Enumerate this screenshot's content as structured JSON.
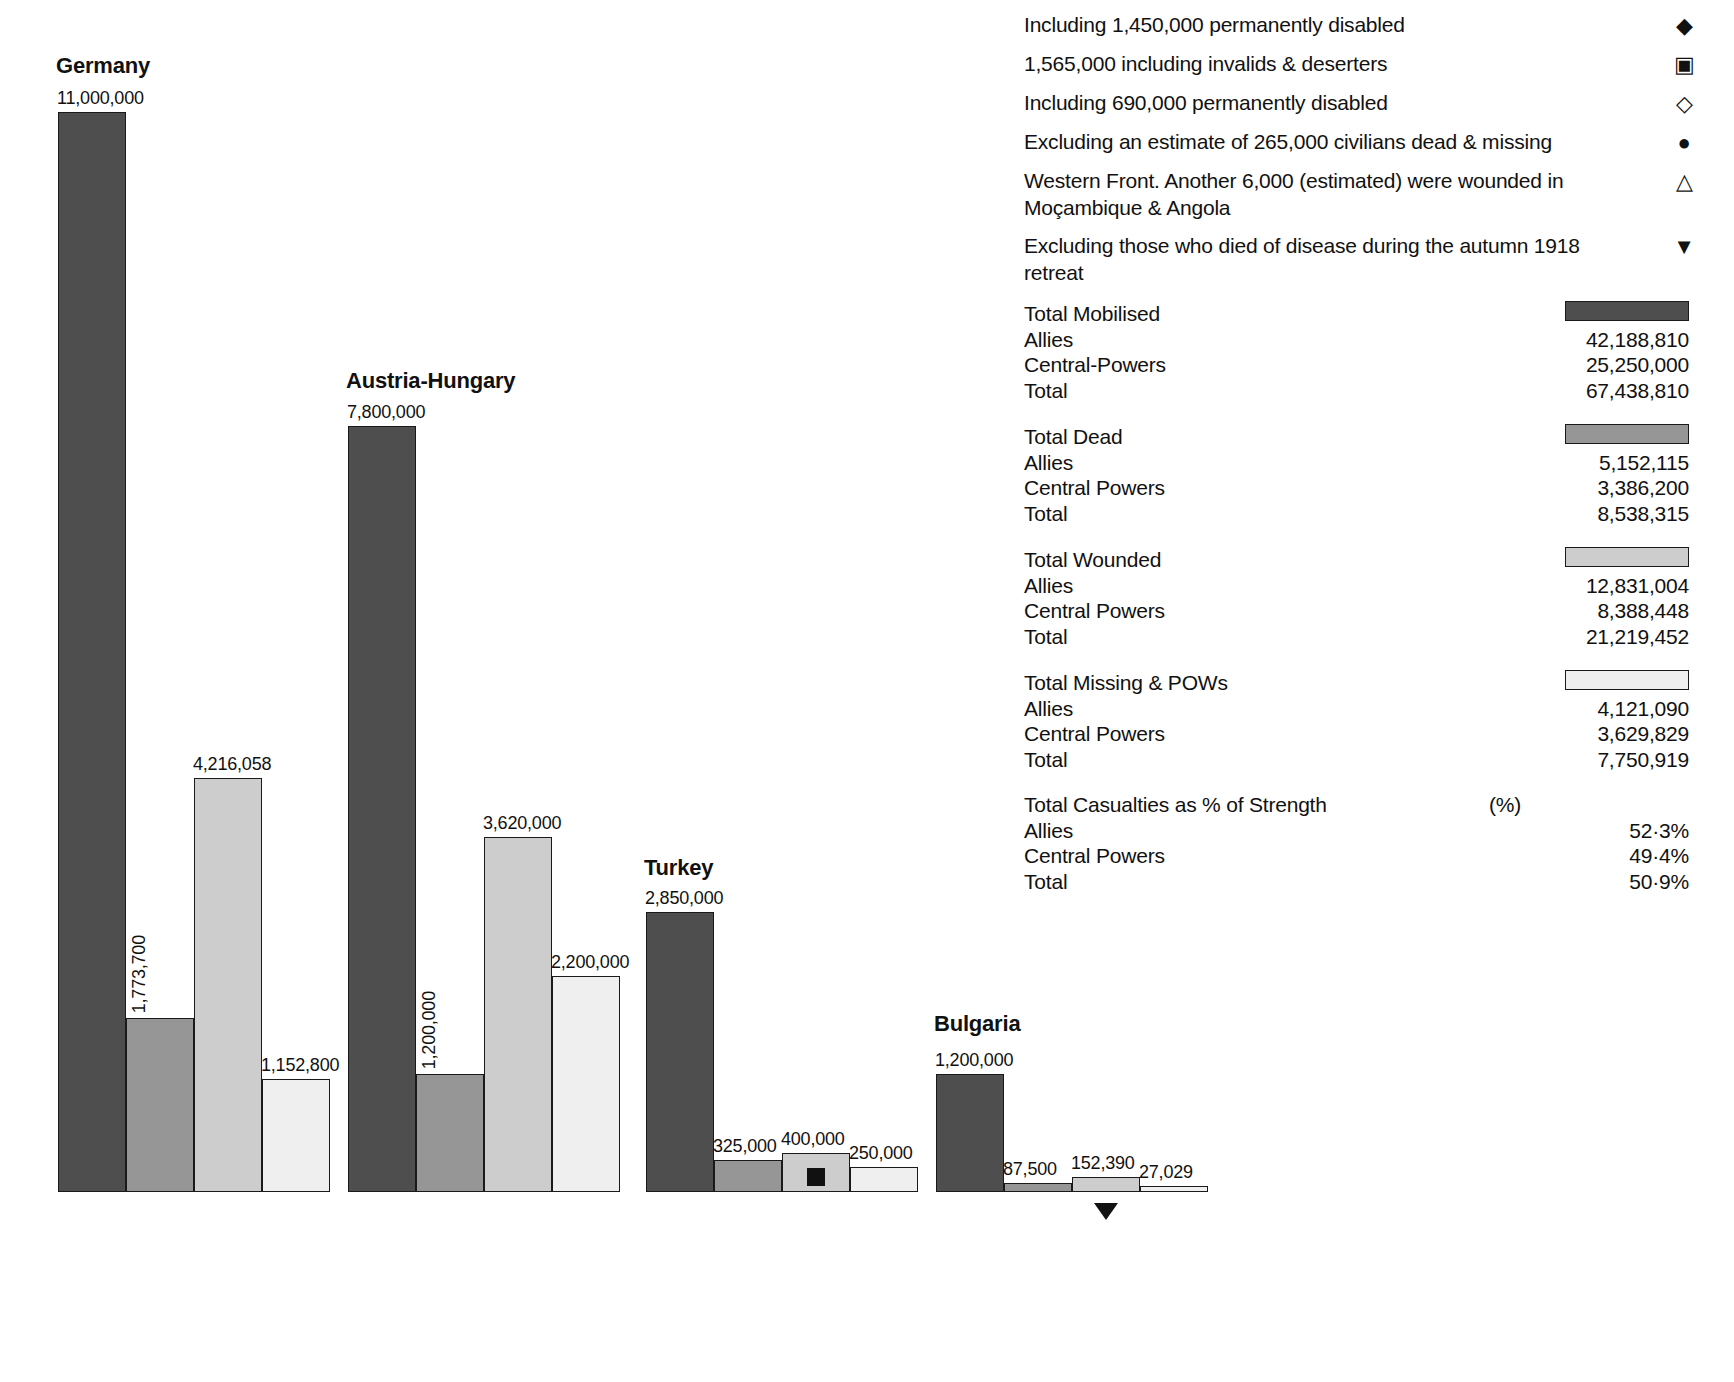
{
  "chart_data": {
    "type": "bar",
    "title": "",
    "xlabel": "",
    "ylabel": "",
    "categories": [
      "Total Mobilised",
      "Total Dead",
      "Total Wounded",
      "Total Missing & POWs"
    ],
    "groups": [
      {
        "name": "Germany",
        "values": [
          11000000,
          1773700,
          4216058,
          1152800
        ],
        "labels": [
          "11,000,000",
          "1,773,700",
          "4,216,058",
          "1,152,800"
        ]
      },
      {
        "name": "Austria-Hungary",
        "values": [
          7800000,
          1200000,
          3620000,
          2200000
        ],
        "labels": [
          "7,800,000",
          "1,200,000",
          "3,620,000",
          "2,200,000"
        ]
      },
      {
        "name": "Turkey",
        "values": [
          2850000,
          325000,
          400000,
          250000
        ],
        "labels": [
          "2,850,000",
          "325,000",
          "400,000",
          "250,000"
        ]
      },
      {
        "name": "Bulgaria",
        "values": [
          1200000,
          87500,
          152390,
          27029
        ],
        "labels": [
          "1,200,000",
          "87,500",
          "152,390",
          "27,029"
        ]
      }
    ],
    "series_colors": [
      "#4e4e4e",
      "#969696",
      "#cdcdcd",
      "#efefef"
    ],
    "markers": [
      {
        "group": "Turkey",
        "series": "Total Wounded",
        "symbol": "filled-square",
        "position": "in-bar"
      },
      {
        "group": "Bulgaria",
        "series": "Total Wounded",
        "symbol": "filled-triangle-down",
        "position": "below-axis"
      }
    ],
    "ylim": [
      0,
      11000000
    ],
    "grid": false,
    "legend_position": "right"
  },
  "groups": [
    {
      "title": "Germany",
      "bars": [
        {
          "series": "mob",
          "label": "11,000,000",
          "orient": "horizontal"
        },
        {
          "series": "dead",
          "label": "1,773,700",
          "orient": "vertical"
        },
        {
          "series": "wnd",
          "label": "4,216,058",
          "orient": "horizontal"
        },
        {
          "series": "miss",
          "label": "1,152,800",
          "orient": "horizontal"
        }
      ]
    },
    {
      "title": "Austria-Hungary",
      "bars": [
        {
          "series": "mob",
          "label": "7,800,000",
          "orient": "horizontal"
        },
        {
          "series": "dead",
          "label": "1,200,000",
          "orient": "vertical"
        },
        {
          "series": "wnd",
          "label": "3,620,000",
          "orient": "horizontal"
        },
        {
          "series": "miss",
          "label": "2,200,000",
          "orient": "horizontal"
        }
      ]
    },
    {
      "title": "Turkey",
      "bars": [
        {
          "series": "mob",
          "label": "2,850,000",
          "orient": "horizontal"
        },
        {
          "series": "dead",
          "label": "325,000",
          "orient": "horizontal"
        },
        {
          "series": "wnd",
          "label": "400,000",
          "orient": "horizontal",
          "marker": "filled-square"
        },
        {
          "series": "miss",
          "label": "250,000",
          "orient": "horizontal"
        }
      ]
    },
    {
      "title": "Bulgaria",
      "bars": [
        {
          "series": "mob",
          "label": "1,200,000",
          "orient": "horizontal"
        },
        {
          "series": "dead",
          "label": "87,500",
          "orient": "horizontal"
        },
        {
          "series": "wnd",
          "label": "152,390",
          "orient": "horizontal",
          "marker_below": "filled-triangle-down"
        },
        {
          "series": "miss",
          "label": "27,029",
          "orient": "horizontal"
        }
      ]
    }
  ],
  "footnotes": [
    {
      "text": "Including 1,450,000 permanently disabled",
      "symbol": "◆",
      "symbol_name": "filled-diamond-icon"
    },
    {
      "text": "1,565,000 including invalids & deserters",
      "symbol": "▣",
      "symbol_name": "filled-square-icon"
    },
    {
      "text": "Including 690,000 permanently disabled",
      "symbol": "◇",
      "symbol_name": "open-diamond-icon"
    },
    {
      "text": "Excluding an estimate of 265,000 civilians dead & missing",
      "symbol": "●",
      "symbol_name": "filled-circle-icon"
    },
    {
      "text": "Western Front. Another 6,000 (estimated) were wounded in Moçambique & Angola",
      "symbol": "△",
      "symbol_name": "open-triangle-up-icon"
    },
    {
      "text": "Excluding those who died of disease during the autumn 1918 retreat",
      "symbol": "▼",
      "symbol_name": "filled-triangle-down-icon"
    }
  ],
  "summary": [
    {
      "heading": "Total Mobilised",
      "swatch": "s-mob",
      "rows": [
        {
          "label": "Allies",
          "value": "42,188,810"
        },
        {
          "label": "Central-Powers",
          "value": "25,250,000"
        },
        {
          "label": "Total",
          "value": "67,438,810"
        }
      ]
    },
    {
      "heading": "Total Dead",
      "swatch": "s-dead",
      "rows": [
        {
          "label": "Allies",
          "value": "5,152,115"
        },
        {
          "label": "Central Powers",
          "value": "3,386,200"
        },
        {
          "label": "Total",
          "value": "8,538,315"
        }
      ]
    },
    {
      "heading": "Total Wounded",
      "swatch": "s-wnd",
      "rows": [
        {
          "label": "Allies",
          "value": "12,831,004"
        },
        {
          "label": "Central Powers",
          "value": "8,388,448"
        },
        {
          "label": "Total",
          "value": "21,219,452"
        }
      ]
    },
    {
      "heading": "Total Missing & POWs",
      "swatch": "s-miss",
      "rows": [
        {
          "label": "Allies",
          "value": "4,121,090"
        },
        {
          "label": "Central Powers",
          "value": "3,629,829"
        },
        {
          "label": "Total",
          "value": "7,750,919"
        }
      ]
    },
    {
      "heading": "Total Casualties as % of Strength",
      "swatch": null,
      "heading_value": "(%)",
      "rows": [
        {
          "label": "Allies",
          "value": "52·3%"
        },
        {
          "label": "Central Powers",
          "value": "49·4%"
        },
        {
          "label": "Total",
          "value": "50·9%"
        }
      ]
    }
  ],
  "colors": {
    "mobilised": "#4e4e4e",
    "dead": "#969696",
    "wounded": "#cdcdcd",
    "missing": "#efefef",
    "outline": "#1a1a1a",
    "background": "#ffffff"
  }
}
